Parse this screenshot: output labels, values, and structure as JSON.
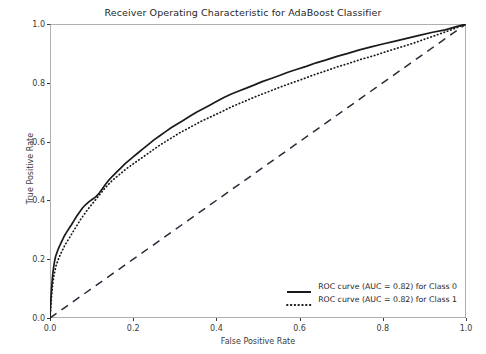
{
  "chart_data": {
    "type": "line",
    "title": "Receiver Operating Characteristic for AdaBoost Classifier",
    "xlabel": "False Positive Rate",
    "ylabel": "True Positive Rate",
    "xlim": [
      0.0,
      1.0
    ],
    "ylim": [
      0.0,
      1.0
    ],
    "xticks": [
      "0.0",
      "0.2",
      "0.4",
      "0.6",
      "0.8",
      "1.0"
    ],
    "xtick_values": [
      0.0,
      0.2,
      0.4,
      0.6,
      0.8,
      1.0
    ],
    "yticks": [
      "0.0",
      "0.2",
      "0.4",
      "0.6",
      "0.8",
      "1.0"
    ],
    "ytick_values": [
      0.0,
      0.2,
      0.4,
      0.6,
      0.8,
      1.0
    ],
    "grid": false,
    "legend_position": "lower right",
    "colors": {
      "curve_class0": "#1a1a1a",
      "curve_class1": "#1a1a1a",
      "chance_line": "#2b2b3a",
      "axis": "#3b3b3b",
      "background": "#ffffff"
    },
    "series": [
      {
        "name": "ROC curve (AUC = 0.82) for Class 0",
        "auc": 0.82,
        "style": "solid",
        "x": [
          0.0,
          0.002,
          0.004,
          0.006,
          0.008,
          0.01,
          0.012,
          0.014,
          0.018,
          0.022,
          0.026,
          0.03,
          0.034,
          0.04,
          0.046,
          0.052,
          0.058,
          0.064,
          0.07,
          0.078,
          0.086,
          0.094,
          0.102,
          0.11,
          0.118,
          0.126,
          0.134,
          0.142,
          0.15,
          0.16,
          0.17,
          0.18,
          0.19,
          0.2,
          0.212,
          0.224,
          0.236,
          0.25,
          0.264,
          0.278,
          0.292,
          0.306,
          0.32,
          0.336,
          0.352,
          0.368,
          0.384,
          0.4,
          0.418,
          0.436,
          0.454,
          0.472,
          0.49,
          0.51,
          0.53,
          0.55,
          0.572,
          0.594,
          0.616,
          0.64,
          0.664,
          0.69,
          0.716,
          0.744,
          0.772,
          0.8,
          0.83,
          0.86,
          0.89,
          0.92,
          0.95,
          0.975,
          1.0
        ],
        "y": [
          0.0,
          0.06,
          0.105,
          0.14,
          0.165,
          0.185,
          0.2,
          0.212,
          0.228,
          0.242,
          0.254,
          0.266,
          0.278,
          0.292,
          0.305,
          0.318,
          0.332,
          0.346,
          0.358,
          0.374,
          0.386,
          0.396,
          0.404,
          0.412,
          0.424,
          0.44,
          0.456,
          0.47,
          0.482,
          0.496,
          0.51,
          0.524,
          0.536,
          0.548,
          0.562,
          0.576,
          0.59,
          0.606,
          0.62,
          0.634,
          0.648,
          0.66,
          0.672,
          0.686,
          0.7,
          0.712,
          0.724,
          0.736,
          0.75,
          0.762,
          0.772,
          0.782,
          0.792,
          0.804,
          0.814,
          0.824,
          0.836,
          0.846,
          0.856,
          0.868,
          0.878,
          0.89,
          0.9,
          0.912,
          0.922,
          0.932,
          0.942,
          0.952,
          0.962,
          0.972,
          0.98,
          0.99,
          1.0
        ]
      },
      {
        "name": "ROC curve (AUC = 0.82) for Class 1",
        "auc": 0.82,
        "style": "dotted",
        "x": [
          0.0,
          0.002,
          0.004,
          0.006,
          0.009,
          0.012,
          0.015,
          0.019,
          0.023,
          0.027,
          0.031,
          0.036,
          0.042,
          0.048,
          0.054,
          0.06,
          0.067,
          0.074,
          0.082,
          0.09,
          0.098,
          0.106,
          0.114,
          0.122,
          0.13,
          0.14,
          0.15,
          0.16,
          0.172,
          0.184,
          0.196,
          0.208,
          0.222,
          0.236,
          0.25,
          0.264,
          0.28,
          0.296,
          0.312,
          0.328,
          0.344,
          0.362,
          0.38,
          0.398,
          0.416,
          0.436,
          0.456,
          0.476,
          0.496,
          0.518,
          0.54,
          0.562,
          0.586,
          0.61,
          0.636,
          0.662,
          0.69,
          0.718,
          0.748,
          0.778,
          0.808,
          0.84,
          0.872,
          0.904,
          0.936,
          0.968,
          1.0
        ],
        "y": [
          0.0,
          0.04,
          0.078,
          0.11,
          0.14,
          0.162,
          0.18,
          0.196,
          0.21,
          0.222,
          0.234,
          0.248,
          0.262,
          0.276,
          0.29,
          0.304,
          0.32,
          0.336,
          0.352,
          0.368,
          0.382,
          0.396,
          0.41,
          0.424,
          0.438,
          0.454,
          0.468,
          0.48,
          0.494,
          0.508,
          0.52,
          0.532,
          0.546,
          0.56,
          0.574,
          0.588,
          0.602,
          0.616,
          0.63,
          0.642,
          0.654,
          0.668,
          0.68,
          0.692,
          0.704,
          0.718,
          0.73,
          0.742,
          0.754,
          0.766,
          0.778,
          0.79,
          0.802,
          0.814,
          0.828,
          0.84,
          0.854,
          0.866,
          0.88,
          0.892,
          0.906,
          0.92,
          0.934,
          0.95,
          0.966,
          0.982,
          1.0
        ]
      },
      {
        "name": "chance-line",
        "style": "dashed",
        "x": [
          0.0,
          1.0
        ],
        "y": [
          0.0,
          1.0
        ]
      }
    ],
    "legend": [
      {
        "label": "ROC curve (AUC = 0.82) for Class 0",
        "style": "solid"
      },
      {
        "label": "ROC curve (AUC = 0.82) for Class 1",
        "style": "dotted"
      }
    ]
  }
}
